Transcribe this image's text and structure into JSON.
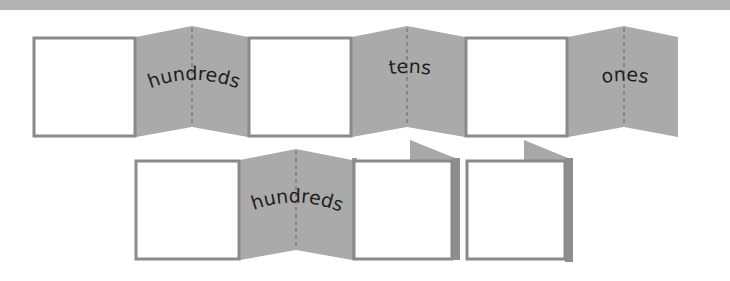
{
  "colors": {
    "panel": "#aaaaaa",
    "box_border": "#8a8a8a",
    "box_fill": "#ffffff",
    "fold_line": "#7c7c7c",
    "top_band": "#b2b2b2",
    "text": "#1e1e1e"
  },
  "row1": {
    "labels": [
      "hundreds",
      "tens",
      "ones"
    ]
  },
  "row2": {
    "labels": [
      "hundreds"
    ]
  }
}
